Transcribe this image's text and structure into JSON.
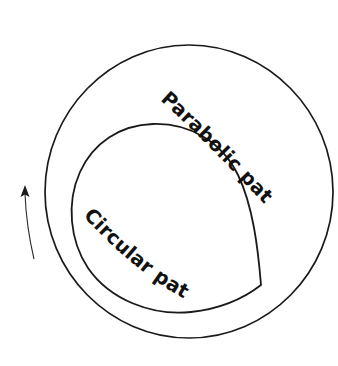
{
  "diagram": {
    "background_color": "#ffffff",
    "stroke_color": "#1a1a1a",
    "labels": {
      "parabolic": "Parabolic path",
      "circular": "Circular path"
    },
    "shapes": {
      "outer_orbit": {
        "name": "outer-circle",
        "cx": 189,
        "cy": 191,
        "r": 145
      },
      "inner_shape": {
        "name": "inner-closed-curve",
        "cusp_x": 261,
        "cusp_y": 285,
        "top_x": 145,
        "top_y": 124,
        "left_x": 72,
        "left_y": 205
      },
      "direction_arrow": {
        "name": "direction-arrow",
        "tip_x": 25,
        "tip_y": 187,
        "tail_x": 33,
        "tail_y": 258,
        "direction": "counterclockwise-up"
      }
    },
    "label_rotation_deg": {
      "parabolic": 45,
      "circular": 40
    }
  }
}
